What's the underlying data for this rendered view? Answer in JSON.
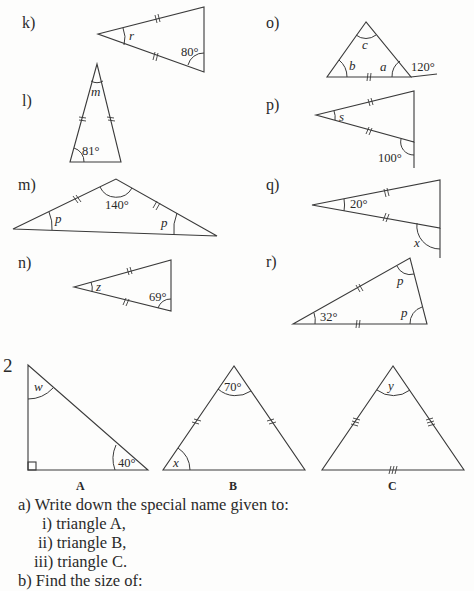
{
  "exercise_1": {
    "items": [
      {
        "label": "k)",
        "given_angle": "80°",
        "unknown": "r"
      },
      {
        "label": "l)",
        "given_angle": "81°",
        "unknown": "m"
      },
      {
        "label": "m)",
        "given_angle": "140°",
        "unknown_1": "p",
        "unknown_2": "p"
      },
      {
        "label": "n)",
        "given_angle": "69°",
        "unknown": "z"
      },
      {
        "label": "o)",
        "given_angle": "120°",
        "unknown_a": "a",
        "unknown_b": "b",
        "unknown_c": "c"
      },
      {
        "label": "p)",
        "given_angle": "100°",
        "unknown": "s"
      },
      {
        "label": "q)",
        "given_angle": "20°",
        "unknown": "x"
      },
      {
        "label": "r)",
        "given_angle": "32°",
        "unknown_1": "p",
        "unknown_2": "p"
      }
    ]
  },
  "exercise_2": {
    "number": "2",
    "triangles": [
      {
        "name": "A",
        "given_angle": "40°",
        "unknown": "w"
      },
      {
        "name": "B",
        "given_angle": "70°",
        "unknown": "x"
      },
      {
        "name": "C",
        "unknown": "y"
      }
    ],
    "questions": {
      "a": "a) Write down the special name given to:",
      "a_i": "i) triangle A,",
      "a_ii": "ii) triangle B,",
      "a_iii": "iii) triangle C.",
      "b": "b) Find the size of:"
    }
  }
}
